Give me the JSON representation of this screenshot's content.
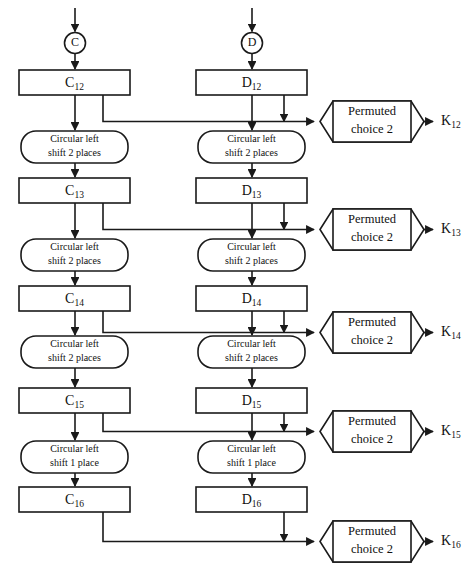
{
  "diagram": {
    "colors": {
      "stroke": "#1a1a1a",
      "fill": "#ffffff",
      "text": "#111111",
      "background": "#ffffff"
    },
    "inputs": [
      {
        "id": "node-c",
        "label": "C",
        "x": 75,
        "y": 43
      },
      {
        "id": "node-d",
        "label": "D",
        "x": 252,
        "y": 43
      }
    ],
    "registers": [
      {
        "id": "reg-c12",
        "base": "C",
        "sub": "12",
        "x": 19,
        "y": 70,
        "w": 111,
        "h": 25
      },
      {
        "id": "reg-d12",
        "base": "D",
        "sub": "12",
        "x": 196,
        "y": 70,
        "w": 111,
        "h": 25
      },
      {
        "id": "reg-c13",
        "base": "C",
        "sub": "13",
        "x": 19,
        "y": 178,
        "w": 111,
        "h": 25
      },
      {
        "id": "reg-d13",
        "base": "D",
        "sub": "13",
        "x": 196,
        "y": 178,
        "w": 111,
        "h": 25
      },
      {
        "id": "reg-c14",
        "base": "C",
        "sub": "14",
        "x": 19,
        "y": 286,
        "w": 111,
        "h": 25
      },
      {
        "id": "reg-d14",
        "base": "D",
        "sub": "14",
        "x": 196,
        "y": 286,
        "w": 111,
        "h": 25
      },
      {
        "id": "reg-c15",
        "base": "C",
        "sub": "15",
        "x": 19,
        "y": 388,
        "w": 111,
        "h": 25
      },
      {
        "id": "reg-d15",
        "base": "D",
        "sub": "15",
        "x": 196,
        "y": 388,
        "w": 111,
        "h": 25
      },
      {
        "id": "reg-c16",
        "base": "C",
        "sub": "16",
        "x": 19,
        "y": 487,
        "w": 111,
        "h": 25
      },
      {
        "id": "reg-d16",
        "base": "D",
        "sub": "16",
        "x": 196,
        "y": 487,
        "w": 111,
        "h": 25
      }
    ],
    "shifts": [
      {
        "id": "shift-c-1",
        "line1": "Circular left",
        "line2": "shift 2 places",
        "x": 21,
        "y": 131,
        "w": 107,
        "h": 32
      },
      {
        "id": "shift-d-1",
        "line1": "Circular left",
        "line2": "shift 2 places",
        "x": 198,
        "y": 131,
        "w": 107,
        "h": 32
      },
      {
        "id": "shift-c-2",
        "line1": "Circular left",
        "line2": "shift 2 places",
        "x": 21,
        "y": 239,
        "w": 107,
        "h": 32
      },
      {
        "id": "shift-d-2",
        "line1": "Circular left",
        "line2": "shift 2 places",
        "x": 198,
        "y": 239,
        "w": 107,
        "h": 32
      },
      {
        "id": "shift-c-3",
        "line1": "Circular left",
        "line2": "shift 2 places",
        "x": 21,
        "y": 336,
        "w": 107,
        "h": 32
      },
      {
        "id": "shift-d-3",
        "line1": "Circular left",
        "line2": "shift 2 places",
        "x": 198,
        "y": 336,
        "w": 107,
        "h": 32
      },
      {
        "id": "shift-c-4",
        "line1": "Circular left",
        "line2": "shift 1 place",
        "x": 21,
        "y": 441,
        "w": 107,
        "h": 32
      },
      {
        "id": "shift-d-4",
        "line1": "Circular left",
        "line2": "shift 1 place",
        "x": 198,
        "y": 441,
        "w": 107,
        "h": 32
      }
    ],
    "permuted_choices": [
      {
        "id": "pc2-12",
        "line1": "Permuted",
        "line2": "choice 2",
        "x": 320,
        "y": 101,
        "w": 104,
        "h": 41
      },
      {
        "id": "pc2-13",
        "line1": "Permuted",
        "line2": "choice 2",
        "x": 320,
        "y": 209,
        "w": 104,
        "h": 41
      },
      {
        "id": "pc2-14",
        "line1": "Permuted",
        "line2": "choice 2",
        "x": 320,
        "y": 312,
        "w": 104,
        "h": 41
      },
      {
        "id": "pc2-15",
        "line1": "Permuted",
        "line2": "choice 2",
        "x": 320,
        "y": 411,
        "w": 104,
        "h": 41
      },
      {
        "id": "pc2-16",
        "line1": "Permuted",
        "line2": "choice 2",
        "x": 320,
        "y": 521,
        "w": 104,
        "h": 41
      }
    ],
    "keys": [
      {
        "id": "key-k12",
        "base": "K",
        "sub": "12",
        "x": 441,
        "y": 122
      },
      {
        "id": "key-k13",
        "base": "K",
        "sub": "13",
        "x": 441,
        "y": 230
      },
      {
        "id": "key-k14",
        "base": "K",
        "sub": "14",
        "x": 441,
        "y": 333
      },
      {
        "id": "key-k15",
        "base": "K",
        "sub": "15",
        "x": 441,
        "y": 432
      },
      {
        "id": "key-k16",
        "base": "K",
        "sub": "16",
        "x": 441,
        "y": 542
      }
    ]
  }
}
